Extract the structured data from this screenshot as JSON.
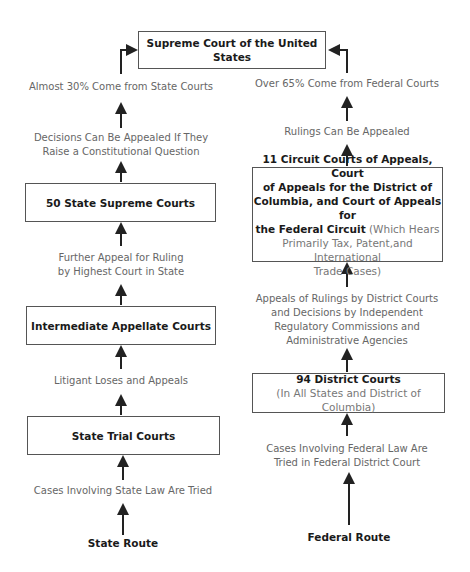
{
  "supreme": {
    "title": "Supreme Court of the United States"
  },
  "state": {
    "route_label": "State Route",
    "top_note": "Almost 30% Come from State Courts",
    "appeal_note_1": "Decisions Can Be Appealed If They",
    "appeal_note_2": "Raise a Constitutional Question",
    "supreme_courts": "50 State Supreme Courts",
    "further_note_1": "Further Appeal for Ruling",
    "further_note_2": "by Highest Court in State",
    "intermediate": "Intermediate Appellate Courts",
    "loses_note": "Litigant Loses and Appeals",
    "trial": "State Trial Courts",
    "cases_note": "Cases Involving State Law Are Tried"
  },
  "federal": {
    "route_label": "Federal Route",
    "top_note": "Over 65% Come from Federal Courts",
    "rulings_note": "Rulings Can Be Appealed",
    "circuit_bold_1": "11 Circuit Courts of Appeals, Court",
    "circuit_bold_2": "of Appeals for the District of",
    "circuit_bold_3": "Columbia, and Court of Appeals for",
    "circuit_bold_4": "the Federal Circuit",
    "circuit_sub_4": " (Which Hears",
    "circuit_sub_5": "Primarily Tax, Patent,and International",
    "circuit_sub_6": "Trade Cases)",
    "appeals_note_1": "Appeals of Rulings by District Courts",
    "appeals_note_2": "and Decisions by Independent",
    "appeals_note_3": "Regulatory Commissions and",
    "appeals_note_4": "Administrative Agencies",
    "district_title": "94 District Courts",
    "district_sub": "(In All States and District of Columbia)",
    "cases_note_1": "Cases Involving Federal Law Are",
    "cases_note_2": "Tried in Federal District Court"
  }
}
